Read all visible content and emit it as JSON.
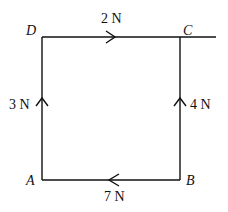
{
  "diagram": {
    "type": "force-square",
    "vertices": {
      "A": {
        "label": "A"
      },
      "B": {
        "label": "B"
      },
      "C": {
        "label": "C"
      },
      "D": {
        "label": "D"
      }
    },
    "forces": [
      {
        "side": "DC",
        "label": "2 N",
        "direction": "D to C"
      },
      {
        "side": "BC",
        "label": "4 N",
        "direction": "B to C"
      },
      {
        "side": "BA",
        "label": "7 N",
        "direction": "B to A"
      },
      {
        "side": "AD",
        "label": "3 N",
        "direction": "A to D"
      }
    ],
    "line_color": "#111111"
  }
}
